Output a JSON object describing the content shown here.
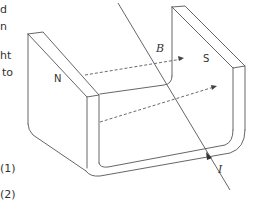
{
  "left_text_fragments": [
    "d",
    "n",
    "ht",
    "to"
  ],
  "option_labels": [
    "(1)",
    "(2)"
  ],
  "diagram": {
    "pole_north_label": "N",
    "pole_south_label": "S",
    "field_label": "B",
    "current_label": "I",
    "stroke_color": "#555555",
    "background": "#ffffff"
  }
}
